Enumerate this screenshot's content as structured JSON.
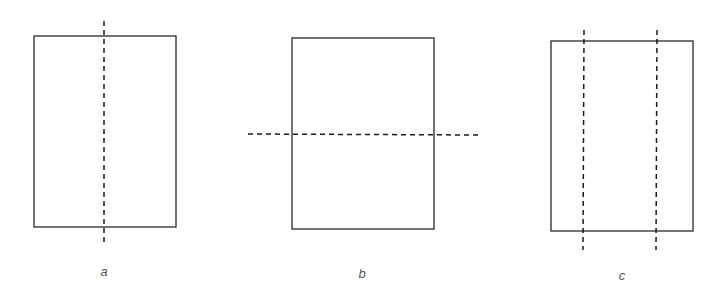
{
  "diagram": {
    "panels": [
      {
        "label": "a",
        "rect": {
          "x": 34,
          "y": 36,
          "w": 142,
          "h": 191
        },
        "folds": [
          {
            "orientation": "vertical",
            "x1": 104,
            "y1": 21,
            "x2": 104,
            "y2": 242
          }
        ],
        "label_pos": {
          "x": 104,
          "y": 264
        }
      },
      {
        "label": "b",
        "rect": {
          "x": 292,
          "y": 38,
          "w": 142,
          "h": 191
        },
        "folds": [
          {
            "orientation": "horizontal",
            "x1": 248,
            "y1": 134,
            "x2": 479,
            "y2": 135
          }
        ],
        "label_pos": {
          "x": 362,
          "y": 266
        }
      },
      {
        "label": "c",
        "rect": {
          "x": 551,
          "y": 41,
          "w": 142,
          "h": 190
        },
        "folds": [
          {
            "orientation": "vertical",
            "x1": 584,
            "y1": 30,
            "x2": 583,
            "y2": 250
          },
          {
            "orientation": "vertical",
            "x1": 657,
            "y1": 30,
            "x2": 656,
            "y2": 250
          }
        ],
        "label_pos": {
          "x": 622,
          "y": 268
        }
      }
    ],
    "colors": {
      "stroke": "#2a2a2a",
      "dash": "#1a1a1a",
      "label": "#555555",
      "background": "#ffffff"
    }
  }
}
